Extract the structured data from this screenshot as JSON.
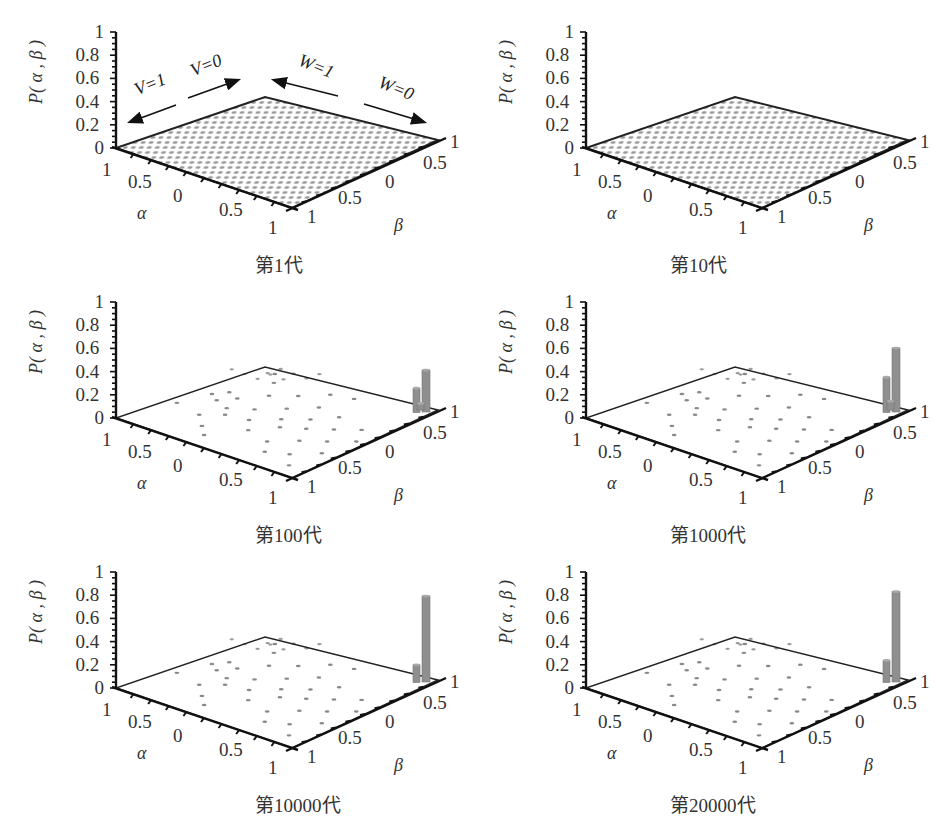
{
  "figure": {
    "panels": [
      {
        "id": "gen1",
        "caption": "第1代",
        "origin": [
          0,
          0
        ],
        "uniform": true
      },
      {
        "id": "gen10",
        "caption": "第10代",
        "origin": [
          470,
          0
        ],
        "uniform": true
      },
      {
        "id": "gen100",
        "caption": "第100代",
        "origin": [
          0,
          270
        ],
        "uniform": false
      },
      {
        "id": "gen1000",
        "caption": "第1000代",
        "origin": [
          470,
          270
        ],
        "uniform": false
      },
      {
        "id": "gen10000",
        "caption": "第10000代",
        "origin": [
          0,
          540
        ],
        "uniform": false
      },
      {
        "id": "gen20000",
        "caption": "第20000代",
        "origin": [
          470,
          540
        ],
        "uniform": false
      }
    ],
    "ylabel": "P( α , β )",
    "xlabel": "α",
    "zlabel": "β",
    "z_ticks": [
      "0",
      "0.2",
      "0.4",
      "0.6",
      "0.8",
      "1"
    ],
    "alpha_ticks": [
      "1",
      "0.5",
      "0",
      "0.5",
      "1"
    ],
    "beta_ticks": [
      "1",
      "0.5",
      "0",
      "0.5",
      "1"
    ],
    "annotations": {
      "v1": "V=1",
      "v0": "V=0",
      "w1": "W=1",
      "w0": "W=0"
    }
  },
  "chart_data": [
    {
      "type": "bar3d",
      "title": "第1代",
      "xlabel": "α",
      "ylabel": "β",
      "zlabel": "P(α, β)",
      "zlim": [
        0,
        1
      ],
      "description": "Uniform distribution over (α, β) grid; all probabilities near 0",
      "annotations": [
        "V=1",
        "V=0",
        "W=1",
        "W=0"
      ],
      "bars": []
    },
    {
      "type": "bar3d",
      "title": "第10代",
      "xlabel": "α",
      "ylabel": "β",
      "zlabel": "P(α, β)",
      "zlim": [
        0,
        1
      ],
      "description": "Uniform distribution over (α, β) grid; all probabilities near 0",
      "bars": []
    },
    {
      "type": "bar3d",
      "title": "第100代",
      "xlabel": "α",
      "ylabel": "β",
      "zlabel": "P(α, β)",
      "zlim": [
        0,
        1
      ],
      "description": "Sparse scattered small points; peaks near α=1, β=1 corner",
      "bars": [
        {
          "alpha": 1,
          "beta": 1,
          "P": 0.38
        },
        {
          "alpha": 0.9,
          "beta": 1,
          "P": 0.22
        },
        {
          "alpha": 1,
          "beta": 0.9,
          "P": 0.06
        }
      ]
    },
    {
      "type": "bar3d",
      "title": "第1000代",
      "xlabel": "α",
      "ylabel": "β",
      "zlabel": "P(α, β)",
      "zlim": [
        0,
        1
      ],
      "bars": [
        {
          "alpha": 1,
          "beta": 1,
          "P": 0.58
        },
        {
          "alpha": 0.9,
          "beta": 1,
          "P": 0.32
        },
        {
          "alpha": 1,
          "beta": 0.9,
          "P": 0.08
        }
      ]
    },
    {
      "type": "bar3d",
      "title": "第10000代",
      "xlabel": "α",
      "ylabel": "β",
      "zlabel": "P(α, β)",
      "zlim": [
        0,
        1
      ],
      "bars": [
        {
          "alpha": 1,
          "beta": 1,
          "P": 0.78
        },
        {
          "alpha": 0.9,
          "beta": 1,
          "P": 0.16
        }
      ]
    },
    {
      "type": "bar3d",
      "title": "第20000代",
      "xlabel": "α",
      "ylabel": "β",
      "zlabel": "P(α, β)",
      "zlim": [
        0,
        1
      ],
      "bars": [
        {
          "alpha": 1,
          "beta": 1,
          "P": 0.82
        },
        {
          "alpha": 0.9,
          "beta": 1,
          "P": 0.2
        }
      ]
    }
  ]
}
